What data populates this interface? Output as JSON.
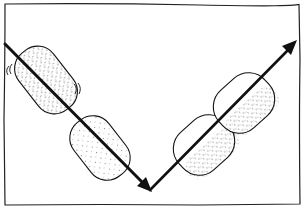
{
  "diagram": {
    "style": "hand-drawn sketch",
    "colors": {
      "background": "#ffffff",
      "ink": "#111111",
      "stipple": "#333333"
    },
    "frame": {
      "x": 4,
      "y": 4,
      "width": 296,
      "height": 200
    },
    "path": {
      "incoming": {
        "from": [
          4,
          44
        ],
        "to": [
          150,
          190
        ]
      },
      "outgoing": {
        "from": [
          150,
          190
        ],
        "to": [
          298,
          40
        ]
      },
      "vertex": [
        150,
        190
      ]
    },
    "objects": [
      {
        "id": "capsule-1",
        "cx": 48,
        "cy": 80,
        "rx": 22,
        "ry": 36,
        "rotate": -38,
        "motion_marks": true
      },
      {
        "id": "capsule-2",
        "cx": 100,
        "cy": 148,
        "rx": 24,
        "ry": 35,
        "rotate": -38,
        "motion_marks": false
      },
      {
        "id": "capsule-3",
        "cx": 204,
        "cy": 145,
        "rx": 26,
        "ry": 32,
        "rotate": 48,
        "motion_marks": false
      },
      {
        "id": "capsule-4",
        "cx": 244,
        "cy": 103,
        "rx": 26,
        "ry": 32,
        "rotate": 48,
        "motion_marks": false
      }
    ]
  }
}
